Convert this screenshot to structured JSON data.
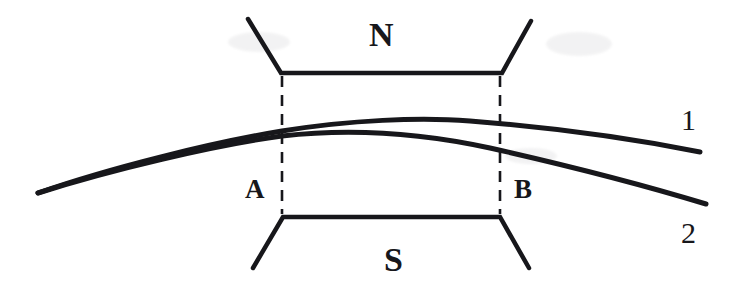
{
  "figure": {
    "background_color": "#ffffff",
    "ink_color": "#17171b",
    "width": 736,
    "height": 292,
    "labels": {
      "north_pole": "N",
      "south_pole": "S",
      "point_a": "A",
      "point_b": "B",
      "curve_one": "1",
      "curve_two": "2"
    },
    "label_positions": {
      "north_pole": {
        "x": 369,
        "y": 18
      },
      "south_pole": {
        "x": 384,
        "y": 243
      },
      "point_a": {
        "x": 245,
        "y": 176
      },
      "point_b": {
        "x": 514,
        "y": 176
      },
      "curve_one": {
        "x": 681,
        "y": 105
      },
      "curve_two": {
        "x": 681,
        "y": 218
      }
    },
    "geometry": {
      "north_pole_outline": "M 248 19 L 281 73 L 502 73 L 531 21",
      "south_pole_outline": "M 253 268 L 283 217 L 500 217 L 529 268",
      "gap_line_a": {
        "x": 282,
        "y_top": 76,
        "y_bottom": 214,
        "dash": "11 8"
      },
      "gap_line_b": {
        "x": 500,
        "y_top": 76,
        "y_bottom": 214,
        "dash": "11 8"
      },
      "curve_one_path": "M 38 193 C 110 168 210 143 282 131 C 350 120 420 117 470 121 C 560 128 645 141 700 152",
      "curve_two_path": "M 38 193 C 110 170 215 145 282 136 C 360 127 430 135 490 148 C 570 166 650 187 706 204",
      "stroke_width_outline": 4.5,
      "stroke_width_curve": 5.0,
      "stroke_width_dashed": 2.6
    },
    "smudges": [
      {
        "x": 228,
        "y": 32,
        "w": 62,
        "h": 20
      },
      {
        "x": 546,
        "y": 32,
        "w": 66,
        "h": 24
      },
      {
        "x": 505,
        "y": 148,
        "w": 52,
        "h": 16
      }
    ]
  }
}
